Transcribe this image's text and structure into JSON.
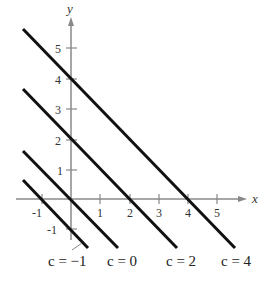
{
  "diagram": {
    "type": "family-of-lines",
    "equation_form": "y = -x + c",
    "axes": {
      "x_label": "x",
      "y_label": "y",
      "x_ticks": [
        "-1",
        "1",
        "2",
        "3",
        "4",
        "5"
      ],
      "y_ticks": [
        "5",
        "4",
        "3",
        "2",
        "1",
        "-1"
      ]
    },
    "lines": [
      {
        "c": -1,
        "label": "c = −1"
      },
      {
        "c": 0,
        "label": "c = 0"
      },
      {
        "c": 2,
        "label": "c = 2"
      },
      {
        "c": 4,
        "label": "c = 4"
      }
    ],
    "colors": {
      "axis": "#888888",
      "line": "#111111",
      "text": "#333333"
    }
  }
}
